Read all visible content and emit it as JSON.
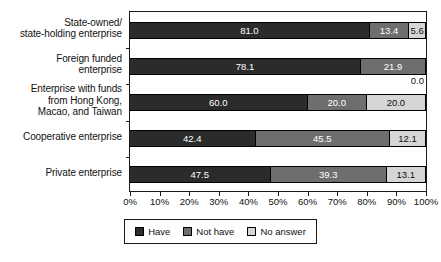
{
  "chart_data": {
    "type": "bar",
    "subtype": "horizontal-stacked-100pct",
    "title": "",
    "subtitle": "",
    "xlabel": "",
    "ylabel": "",
    "xlim": [
      0,
      100
    ],
    "grid": false,
    "legend_position": "bottom-center",
    "categories": [
      "State-owned/\nstate-holding enterprise",
      "Foreign funded\nenterprise",
      "Enterprise with funds\nfrom Hong Kong,\nMacao, and Taiwan",
      "Cooperative enterprise",
      "Private enterprise"
    ],
    "category_lines": [
      [
        "State-owned/",
        "state-holding enterprise"
      ],
      [
        "Foreign funded",
        "enterprise"
      ],
      [
        "Enterprise with funds",
        "from Hong Kong,",
        "Macao, and Taiwan"
      ],
      [
        "Cooperative enterprise"
      ],
      [
        "Private enterprise"
      ]
    ],
    "series": [
      {
        "name": "Have",
        "color": "#2b2b2b",
        "text_color": "#ffffff",
        "values": [
          81.0,
          78.1,
          60.0,
          42.4,
          47.5
        ]
      },
      {
        "name": "Not have",
        "color": "#6e6e6e",
        "text_color": "#ffffff",
        "values": [
          13.4,
          21.9,
          20.0,
          45.5,
          39.3
        ]
      },
      {
        "name": "No answer",
        "color": "#d6d6d6",
        "text_color": "#111111",
        "values": [
          5.6,
          0.0,
          20.0,
          12.1,
          13.1
        ]
      }
    ],
    "bar_labels": [
      [
        "81.0",
        "13.4",
        "5.6"
      ],
      [
        "78.1",
        "21.9",
        "0.0"
      ],
      [
        "60.0",
        "20.0",
        "20.0"
      ],
      [
        "42.4",
        "45.5",
        "12.1"
      ],
      [
        "47.5",
        "39.3",
        "13.1"
      ]
    ],
    "xticks": [
      0,
      10,
      20,
      30,
      40,
      50,
      60,
      70,
      80,
      90,
      100
    ],
    "xtick_labels": [
      "0%",
      "10%",
      "20%",
      "30%",
      "40%",
      "50%",
      "60%",
      "70%",
      "80%",
      "90%",
      "100%"
    ],
    "legend": [
      "Have",
      "Not have",
      "No answer"
    ]
  },
  "colors": {
    "have": "#2b2b2b",
    "not_have": "#6e6e6e",
    "no_answer": "#d6d6d6",
    "axis": "#1a1a1a",
    "background": "#ffffff",
    "text": "#111111"
  }
}
